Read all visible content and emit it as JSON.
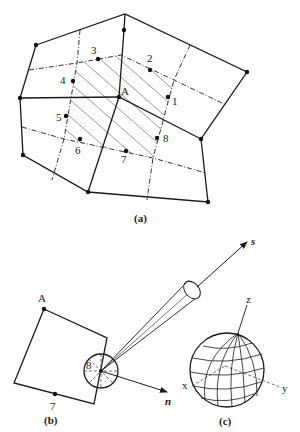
{
  "figure": {
    "panel_a": {
      "caption": "(a)",
      "center_label": "A",
      "point_labels": [
        "1",
        "2",
        "3",
        "4",
        "5",
        "6",
        "7",
        "8"
      ]
    },
    "panel_b": {
      "caption": "(b)",
      "corner_label": "A",
      "point_labels": [
        "7",
        "8"
      ],
      "axis_s": "s",
      "axis_n": "n"
    },
    "panel_c": {
      "caption": "(c)",
      "axis_x": "x",
      "axis_y": "y",
      "axis_z": "z"
    }
  }
}
